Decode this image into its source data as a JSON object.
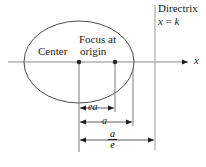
{
  "figure": {
    "kind": "ellipse-focus-directrix-diagram",
    "background": "#ffffff",
    "ink": "#1a1a1a",
    "width": 206,
    "height": 167
  },
  "labels": {
    "directrix": "Directrix",
    "directrix_equation_var": "x",
    "directrix_equation_rel": " = ",
    "directrix_equation_val": "k",
    "focus_at": "Focus at",
    "center": "Center",
    "origin": "origin",
    "axis_x": "x",
    "dim_ea": "ea",
    "dim_a": "a",
    "frac_numerator": "a",
    "frac_denominator": "e"
  },
  "geometry": {
    "ellipse": {
      "cx": 79,
      "cy": 62,
      "rx": 55,
      "ry": 41
    },
    "center_point": {
      "x": 79,
      "y": 62
    },
    "focus_point": {
      "x": 115,
      "y": 62
    },
    "x_axis": {
      "x1": 8,
      "x2": 190,
      "y": 62
    },
    "directrix_line": {
      "x": 155,
      "y1": 5,
      "y2": 150
    },
    "drop_lines": [
      {
        "name": "center-drop",
        "x": 79,
        "y1": 62,
        "y2": 152
      },
      {
        "name": "focus-drop",
        "x": 115,
        "y1": 62,
        "y2": 110
      },
      {
        "name": "vertex-drop",
        "x": 133,
        "y1": 70,
        "y2": 126
      }
    ],
    "measures": [
      {
        "name": "ea",
        "x1": 79,
        "x2": 115,
        "y": 108
      },
      {
        "name": "a",
        "x1": 79,
        "x2": 133,
        "y": 122
      },
      {
        "name": "a-over-e",
        "x1": 79,
        "x2": 155,
        "y": 140
      }
    ]
  }
}
